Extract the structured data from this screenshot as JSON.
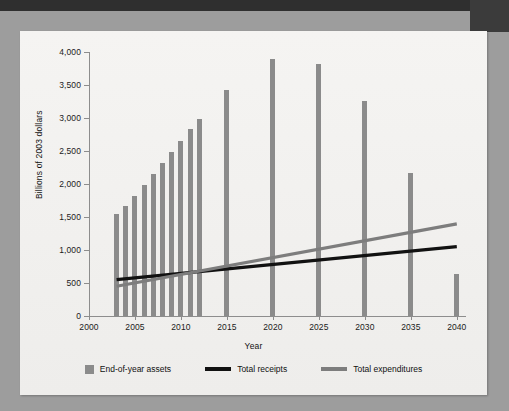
{
  "figure": {
    "y_axis_title": "Billions of 2003 dollars",
    "x_axis_title": "Year"
  },
  "legend": {
    "items": [
      {
        "label": "End-of-year assets",
        "marker": "square-swatch",
        "color": "#8b8b8b"
      },
      {
        "label": "Total receipts",
        "marker": "line-swatch",
        "color": "#111111"
      },
      {
        "label": "Total expenditures",
        "marker": "line-swatch",
        "color": "#7d7d7d"
      }
    ]
  },
  "chart_data": {
    "type": "bar",
    "title": "",
    "subtitle": "",
    "xlabel": "Year",
    "ylabel": "Billions of 2003 dollars",
    "xlim": [
      2000,
      2041
    ],
    "ylim": [
      0,
      4000
    ],
    "ytick_labels": [
      "0",
      "500",
      "1,000",
      "1,500",
      "2,000",
      "2,500",
      "3,000",
      "3,500",
      "4,000"
    ],
    "ytick_values": [
      0,
      500,
      1000,
      1500,
      2000,
      2500,
      3000,
      3500,
      4000
    ],
    "xtick_labels": [
      "2000",
      "2005",
      "2010",
      "2015",
      "2020",
      "2025",
      "2030",
      "2035",
      "2040"
    ],
    "xtick_values": [
      2000,
      2005,
      2010,
      2015,
      2020,
      2025,
      2030,
      2035,
      2040
    ],
    "grid": false,
    "legend_position": "bottom",
    "series": [
      {
        "name": "End-of-year assets",
        "type": "bar",
        "color": "#8b8b8b",
        "x": [
          2003,
          2004,
          2005,
          2006,
          2007,
          2008,
          2009,
          2010,
          2011,
          2012,
          2015,
          2020,
          2025,
          2030,
          2035,
          2040
        ],
        "values": [
          1540,
          1660,
          1825,
          1980,
          2150,
          2325,
          2480,
          2655,
          2830,
          2990,
          3430,
          3900,
          3820,
          3260,
          2165,
          630
        ]
      },
      {
        "name": "Total receipts",
        "type": "line",
        "color": "#111111",
        "x": [
          2003,
          2040
        ],
        "values": [
          550,
          1050
        ]
      },
      {
        "name": "Total expenditures",
        "type": "line",
        "color": "#7d7d7d",
        "x": [
          2003,
          2040
        ],
        "values": [
          450,
          1395
        ]
      }
    ],
    "annotations": []
  }
}
